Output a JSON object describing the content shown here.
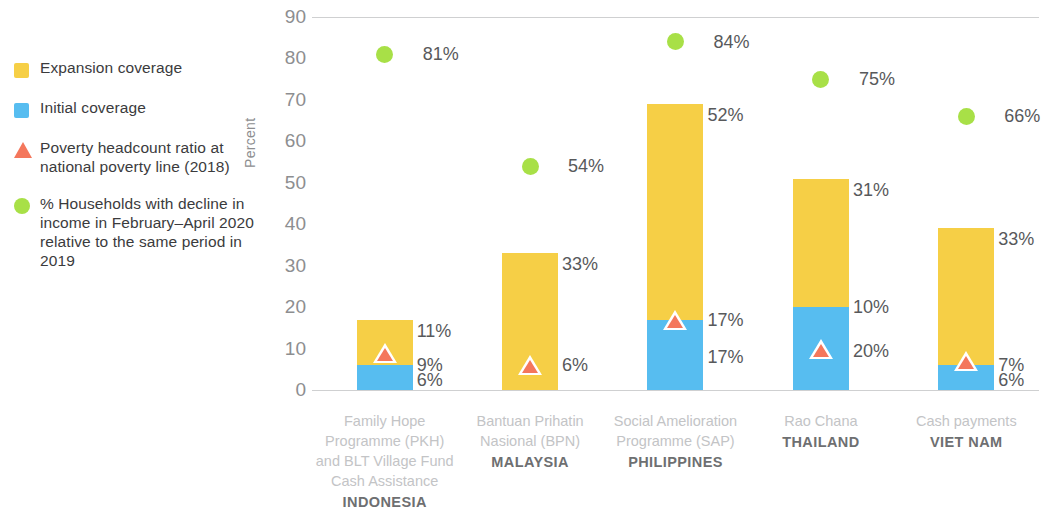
{
  "legend": {
    "items": [
      {
        "marker": "yellow-square-icon",
        "color": "#f6cf46",
        "label": "Expansion coverage"
      },
      {
        "marker": "blue-square-icon",
        "color": "#57bdf0",
        "label": "Initial coverage"
      },
      {
        "marker": "orange-triangle-icon",
        "color": "#f4775c",
        "label": "Poverty headcount ratio at national poverty line (2018)"
      },
      {
        "marker": "green-circle-icon",
        "color": "#a8e047",
        "label": "% Households with decline in income in February–April 2020 relative to the same period in 2019"
      }
    ]
  },
  "chart_data": {
    "type": "bar",
    "title": "",
    "xlabel": "",
    "ylabel": "Percent",
    "ylim": [
      0,
      90
    ],
    "yticks": [
      0,
      10,
      20,
      30,
      40,
      50,
      60,
      70,
      80,
      90
    ],
    "ytick_labels": [
      "0",
      "10",
      "20",
      "30",
      "40",
      "50",
      "60",
      "70",
      "80",
      "90"
    ],
    "grid": "top-and-baseline-only",
    "legend_position": "outside-left",
    "stacked": true,
    "categories": [
      "Family Hope Programme (PKH) and BLT Village Fund Cash Assistance",
      "Bantuan Prihatin Nasional (BPN)",
      "Social Amelioration Programme (SAP)",
      "Rao Chana",
      "Cash payments"
    ],
    "countries": [
      "INDONESIA",
      "MALAYSIA",
      "PHILIPPINES",
      "THAILAND",
      "VIET NAM"
    ],
    "series": [
      {
        "name": "Initial coverage",
        "color": "#57bdf0",
        "values": [
          6,
          0,
          17,
          20,
          6
        ]
      },
      {
        "name": "Expansion coverage",
        "color": "#f6cf46",
        "values": [
          11,
          33,
          52,
          31,
          33
        ]
      },
      {
        "name": "Poverty headcount ratio at national poverty line (2018)",
        "color": "#f4775c",
        "marker": "triangle",
        "values": [
          9,
          6,
          17,
          10,
          7
        ]
      },
      {
        "name": "% Households with decline in income in February-April 2020 relative to the same period in 2019",
        "color": "#a8e047",
        "marker": "circle",
        "values": [
          81,
          54,
          84,
          75,
          66
        ]
      }
    ],
    "bars": [
      {
        "country": "INDONESIA",
        "programme_lines": [
          "Family Hope",
          "Programme (PKH)",
          "and BLT Village Fund",
          "Cash Assistance"
        ],
        "initial": 6,
        "initial_label": "6%",
        "expansion": 11,
        "expansion_label": "11%",
        "poverty": 9,
        "poverty_label": "9%",
        "decline": 81,
        "decline_label": "81%"
      },
      {
        "country": "MALAYSIA",
        "programme_lines": [
          "Bantuan Prihatin",
          "Nasional (BPN)"
        ],
        "initial": 0,
        "initial_label": "",
        "expansion": 33,
        "expansion_label": "33%",
        "poverty": 6,
        "poverty_label": "6%",
        "decline": 54,
        "decline_label": "54%"
      },
      {
        "country": "PHILIPPINES",
        "programme_lines": [
          "Social Amelioration",
          "Programme (SAP)"
        ],
        "initial": 17,
        "initial_label": "17%",
        "expansion": 52,
        "expansion_label": "52%",
        "poverty": 17,
        "poverty_label": "17%",
        "decline": 84,
        "decline_label": "84%"
      },
      {
        "country": "THAILAND",
        "programme_lines": [
          "Rao Chana"
        ],
        "initial": 20,
        "initial_label": "20%",
        "expansion": 31,
        "expansion_label": "31%",
        "poverty": 10,
        "poverty_label": "10%",
        "decline": 75,
        "decline_label": "75%"
      },
      {
        "country": "VIET NAM",
        "programme_lines": [
          "Cash payments"
        ],
        "initial": 6,
        "initial_label": "6%",
        "expansion": 33,
        "expansion_label": "33%",
        "poverty": 7,
        "poverty_label": "7%",
        "decline": 66,
        "decline_label": "66%"
      }
    ]
  }
}
